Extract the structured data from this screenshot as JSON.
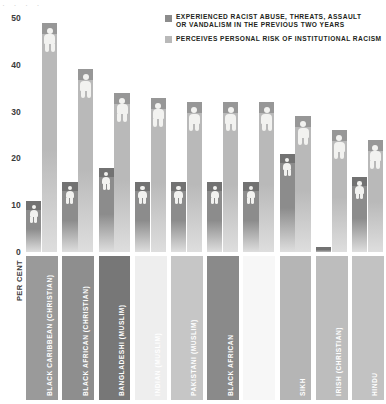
{
  "chart_data": {
    "type": "bar",
    "title": "",
    "xlabel": "",
    "ylabel": "PER CENT",
    "ylim": [
      0,
      50
    ],
    "yticks": [
      0,
      10,
      20,
      30,
      40,
      50
    ],
    "grid": false,
    "legend_position": "top-right",
    "categories": [
      "BLACK CARIBBEAN (CHRISTIAN)",
      "BLACK AFRICAN (CHRISTIAN)",
      "BANGLADESHI (MUSLIM)",
      "INDIAN (MUSLIM)",
      "PAKISTANI (MUSLIM)",
      "BLACK AFRICAN",
      "",
      "SIKH",
      "IRISH (CHRISTIAN)",
      "HINDU"
    ],
    "series": [
      {
        "name": "EXPERIENCED RACIST ABUSE, THREATS, ASSAULT OR VANDALISM IN THE PREVIOUS TWO YEARS",
        "color": "#8c8c8c",
        "values": [
          11,
          15,
          18,
          15,
          15,
          15,
          15,
          21,
          1,
          16
        ]
      },
      {
        "name": "PERCEIVES PERSONAL RISK OF INSTITUTIONAL RACISM",
        "color": "#b9b9b9",
        "values": [
          49,
          39,
          34,
          33,
          32,
          32,
          32,
          29,
          26,
          24
        ]
      }
    ]
  },
  "legend": {
    "items": [
      {
        "swatch_color": "#8c8c8c",
        "line1": "EXPERIENCED RACIST ABUSE, THREATS, ASSAULT",
        "line2": "OR VANDALISM IN THE PREVIOUS TWO YEARS"
      },
      {
        "swatch_color": "#b9b9b9",
        "line1": "PERCEIVES PERSONAL RISK OF INSTITUTIONAL RACISM",
        "line2": ""
      }
    ]
  },
  "axis": {
    "y_label": "PER CENT",
    "y_ticks": [
      "50",
      "40",
      "30",
      "20",
      "10",
      "0"
    ]
  },
  "category_blocks": [
    {
      "label": "BLACK CARIBBEAN (CHRISTIAN)",
      "fill": "#9a9a9a",
      "text_color": "#ffffff"
    },
    {
      "label": "BLACK AFRICAN (CHRISTIAN)",
      "fill": "#8e8e8e",
      "text_color": "#ffffff"
    },
    {
      "label": "BANGLADESHI (MUSLIM)",
      "fill": "#777777",
      "text_color": "#ffffff"
    },
    {
      "label": "INDIAN (MUSLIM)",
      "fill": "#eeeeee",
      "text_color": "#ffffff"
    },
    {
      "label": "PAKISTANI (MUSLIM)",
      "fill": "#c6c6c6",
      "text_color": "#ffffff"
    },
    {
      "label": "BLACK AFRICAN",
      "fill": "#8a8a8a",
      "text_color": "#ffffff"
    },
    {
      "label": "",
      "fill": "#f7f7f7",
      "text_color": "#ffffff"
    },
    {
      "label": "SIKH",
      "fill": "#b5b5b5",
      "text_color": "#ffffff"
    },
    {
      "label": "IRISH (CHRISTIAN)",
      "fill": "#bdbdbd",
      "text_color": "#ffffff"
    },
    {
      "label": "HINDU",
      "fill": "#c2c2c2",
      "text_color": "#ffffff"
    }
  ],
  "crop_fragment": "· · · ·"
}
